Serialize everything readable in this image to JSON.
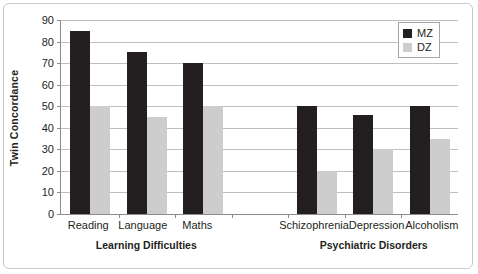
{
  "chart_data": {
    "type": "bar",
    "title": "",
    "xlabel": "",
    "ylabel": "Twin Concordance",
    "ylim": [
      0,
      90
    ],
    "ytick_step": 10,
    "yticks": [
      90,
      80,
      70,
      60,
      50,
      40,
      30,
      20,
      10,
      0
    ],
    "grid": true,
    "legend_position": "top-right",
    "categories": [
      "Reading",
      "Language",
      "Maths",
      "",
      "Schizophrenia",
      "Depression",
      "Alcoholism"
    ],
    "series": [
      {
        "name": "MZ",
        "color": "#231f20",
        "values": [
          85,
          75,
          70,
          null,
          50,
          46,
          50
        ]
      },
      {
        "name": "DZ",
        "color": "#cdcdcd",
        "values": [
          50,
          45,
          50,
          null,
          20,
          30,
          35
        ]
      }
    ],
    "groups": [
      {
        "label": "Learning Difficulties",
        "span": 3
      },
      {
        "label": "",
        "span": 1
      },
      {
        "label": "Psychiatric Disorders",
        "span": 3
      }
    ]
  },
  "legend": {
    "items": [
      {
        "label": "MZ",
        "swatch": "mz"
      },
      {
        "label": "DZ",
        "swatch": "dz"
      }
    ]
  }
}
